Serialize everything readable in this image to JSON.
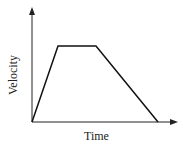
{
  "chart_data": {
    "type": "line",
    "title": "",
    "xlabel": "Time",
    "ylabel": "Velocity",
    "x": [
      0,
      0.18,
      0.44,
      0.87
    ],
    "values": [
      0,
      1,
      1,
      0
    ],
    "grid": false,
    "legend": null,
    "ticks": "none"
  },
  "diagram": {
    "axis_color": "#222222",
    "line_color": "#111111",
    "points_px": [
      [
        32,
        122
      ],
      [
        58,
        46
      ],
      [
        96,
        46
      ],
      [
        158,
        122
      ]
    ]
  }
}
